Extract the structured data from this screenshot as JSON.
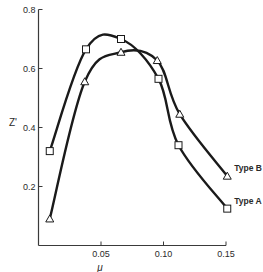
{
  "chart_data": {
    "type": "line",
    "title": "",
    "xlabel": "μ",
    "ylabel": "Z'",
    "xlim": [
      0,
      0.15
    ],
    "ylim": [
      0,
      0.8
    ],
    "grid": false,
    "legend_position": "inline-right",
    "x_ticks": [
      {
        "value": 0.05,
        "label": "0.05"
      },
      {
        "value": 0.1,
        "label": "0.10"
      },
      {
        "value": 0.15,
        "label": "0.15"
      }
    ],
    "y_ticks": [
      {
        "value": 0.2,
        "label": "0.2"
      },
      {
        "value": 0.4,
        "label": "0.4"
      },
      {
        "value": 0.6,
        "label": "0.6"
      },
      {
        "value": 0.8,
        "label": "0.8"
      }
    ],
    "series": [
      {
        "name": "Type A",
        "marker": "square",
        "x": [
          0.009,
          0.038,
          0.066,
          0.096,
          0.112,
          0.151
        ],
        "values": [
          0.32,
          0.665,
          0.7,
          0.565,
          0.34,
          0.125
        ]
      },
      {
        "name": "Type B",
        "marker": "triangle",
        "x": [
          0.009,
          0.037,
          0.066,
          0.095,
          0.113,
          0.151
        ],
        "values": [
          0.09,
          0.555,
          0.655,
          0.627,
          0.445,
          0.235
        ]
      }
    ]
  },
  "colors": {
    "line": "#1a1a1a",
    "axis": "#3a3a3a",
    "marker_fill": "#ffffff"
  }
}
